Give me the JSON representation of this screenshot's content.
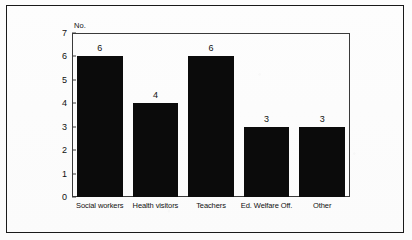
{
  "figure": {
    "border_color": "#1a1a1a",
    "background_color": "#fdfdfd"
  },
  "chart_data": {
    "type": "bar",
    "title": "",
    "subtitle": "",
    "xlabel": "",
    "ylabel": "No.",
    "categories": [
      "Social workers",
      "Health visitors",
      "Teachers",
      "Ed. Welfare Off.",
      "Other"
    ],
    "values": [
      6,
      4,
      6,
      3,
      3
    ],
    "value_labels": [
      "6",
      "4",
      "6",
      "3",
      "3"
    ],
    "ylim": [
      0,
      7
    ],
    "yticks": [
      0,
      1,
      2,
      3,
      4,
      5,
      6,
      7
    ],
    "ytick_labels": [
      "0",
      "1",
      "2",
      "3",
      "4",
      "5",
      "6",
      "7"
    ],
    "grid": false,
    "legend": null,
    "bar_color": "#0b0b0b",
    "axis_color": "#3a3a3a",
    "annotations": []
  }
}
